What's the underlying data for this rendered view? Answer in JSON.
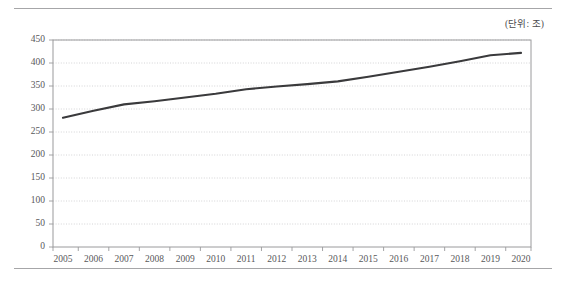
{
  "figure": {
    "unit_note": "(단위: 조)",
    "border_color": "#a6a6a8",
    "plot_border_color": "#9a9a9c",
    "gridline_color": "#c9c9cb",
    "line_color": "#3a3a3c",
    "text_color": "#58585a",
    "background": "#ffffff"
  },
  "chart_data": {
    "type": "line",
    "title": "",
    "subtitle": "",
    "annotations": [
      "(단위: 조)"
    ],
    "xlabel": "",
    "ylabel": "",
    "unit": "조",
    "grid": true,
    "legend": "none",
    "xlim": [
      2005,
      2020
    ],
    "ylim": [
      0,
      450
    ],
    "ytick_step": 50,
    "yticks": [
      450,
      400,
      350,
      300,
      250,
      200,
      150,
      100,
      50,
      0
    ],
    "ytick_labels": [
      "450",
      "400",
      "350",
      "300",
      "250",
      "200",
      "150",
      "100",
      "50",
      "0"
    ],
    "categories": [
      2005,
      2006,
      2007,
      2008,
      2009,
      2010,
      2011,
      2012,
      2013,
      2014,
      2015,
      2016,
      2017,
      2018,
      2019,
      2020
    ],
    "xtick_labels": [
      "2005",
      "2006",
      "2007",
      "2008",
      "2009",
      "2010",
      "2011",
      "2012",
      "2013",
      "2014",
      "2015",
      "2016",
      "2017",
      "2018",
      "2019",
      "2020"
    ],
    "series": [
      {
        "name": "",
        "values": [
          281,
          296,
          310,
          317,
          325,
          333,
          343,
          349,
          354,
          360,
          370,
          381,
          392,
          404,
          417,
          422
        ]
      }
    ]
  }
}
